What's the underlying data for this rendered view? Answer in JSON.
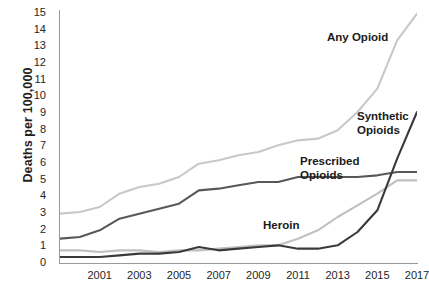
{
  "chart_data": {
    "type": "line",
    "title": "",
    "xlabel": "",
    "ylabel": "Deaths per 100,000",
    "xlim": [
      1999,
      2017
    ],
    "ylim": [
      0,
      15
    ],
    "grid": false,
    "legend": "inline-annotations",
    "x": [
      1999,
      2000,
      2001,
      2002,
      2003,
      2004,
      2005,
      2006,
      2007,
      2008,
      2009,
      2010,
      2011,
      2012,
      2013,
      2014,
      2015,
      2016,
      2017
    ],
    "y_ticks": [
      0,
      1,
      2,
      3,
      4,
      5,
      6,
      7,
      8,
      9,
      10,
      11,
      12,
      13,
      14,
      15
    ],
    "x_ticks": [
      2001,
      2003,
      2005,
      2007,
      2009,
      2011,
      2013,
      2015,
      2017
    ],
    "series": [
      {
        "name": "Any Opioid",
        "color": "#c8c8c8",
        "label": "Any Opioid",
        "values": [
          2.9,
          3.0,
          3.3,
          4.1,
          4.5,
          4.7,
          5.1,
          5.9,
          6.1,
          6.4,
          6.6,
          7.0,
          7.3,
          7.4,
          7.9,
          9.0,
          10.4,
          13.3,
          14.9
        ]
      },
      {
        "name": "Prescribed Opioids",
        "color": "#585858",
        "label": "Prescribed\nOpioids",
        "values": [
          1.4,
          1.5,
          1.9,
          2.6,
          2.9,
          3.2,
          3.5,
          4.3,
          4.4,
          4.6,
          4.8,
          4.8,
          5.1,
          5.1,
          5.1,
          5.1,
          5.2,
          5.4,
          5.4
        ]
      },
      {
        "name": "Heroin",
        "color": "#c0c0c0",
        "label": "Heroin",
        "values": [
          0.7,
          0.7,
          0.6,
          0.7,
          0.7,
          0.6,
          0.7,
          0.7,
          0.8,
          0.9,
          1.0,
          1.0,
          1.4,
          1.9,
          2.7,
          3.4,
          4.1,
          4.9,
          4.9
        ]
      },
      {
        "name": "Synthetic Opioids",
        "color": "#3a3a3a",
        "label": "Synthetic\nOpioids",
        "values": [
          0.3,
          0.3,
          0.3,
          0.4,
          0.5,
          0.5,
          0.6,
          0.9,
          0.7,
          0.8,
          0.9,
          1.0,
          0.8,
          0.8,
          1.0,
          1.8,
          3.1,
          6.2,
          9.0
        ]
      }
    ]
  },
  "axis": {
    "y_title": "Deaths per 100,000"
  },
  "clipped_title": ""
}
